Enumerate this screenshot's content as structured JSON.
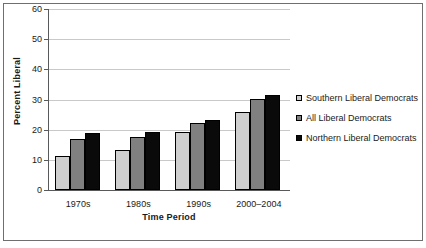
{
  "chart_data": {
    "type": "bar",
    "title": "",
    "xlabel": "Time Period",
    "ylabel": "Percent Liberal",
    "categories": [
      "1970s",
      "1980s",
      "1990s",
      "2000–2004"
    ],
    "series": [
      {
        "name": "Southern Liberal Democrats",
        "color": "#cfcfcf",
        "values": [
          11.2,
          13.2,
          19.2,
          25.7
        ]
      },
      {
        "name": "All Liberal Democrats",
        "color": "#808080",
        "values": [
          17.0,
          17.5,
          22.1,
          30.2
        ]
      },
      {
        "name": "Northern Liberal Democrats",
        "color": "#0a0a0a",
        "values": [
          18.8,
          19.2,
          23.1,
          31.5
        ]
      }
    ],
    "ylim": [
      0,
      60
    ],
    "yticks": [
      0,
      10,
      20,
      30,
      40,
      50,
      60
    ],
    "ytick_labels": [
      "0",
      "10",
      "20",
      "30",
      "40",
      "50",
      "60"
    ],
    "grid": true,
    "legend_position": "right"
  },
  "legend": {
    "items": [
      {
        "label": "Southern Liberal Democrats"
      },
      {
        "label": "All Liberal Democrats"
      },
      {
        "label": "Northern Liberal Democrats"
      }
    ]
  }
}
